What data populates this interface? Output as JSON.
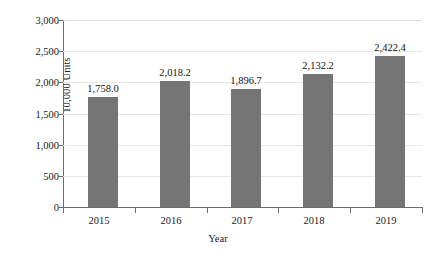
{
  "chart_data": {
    "type": "bar",
    "title": "",
    "xlabel": "Year",
    "ylabel": "10,000 Units",
    "categories": [
      "2015",
      "2016",
      "2017",
      "2018",
      "2019"
    ],
    "values": [
      1758.0,
      2018.2,
      1896.7,
      2132.2,
      2422.4
    ],
    "value_labels": [
      "1,758.0",
      "2,018.2",
      "1,896.7",
      "2,132.2",
      "2,422.4"
    ],
    "ylim": [
      0,
      3000
    ],
    "ytick_values": [
      0,
      500,
      1000,
      1500,
      2000,
      2500,
      3000
    ],
    "ytick_labels": [
      "0",
      "500",
      "1,000",
      "1,500",
      "2,000",
      "2,500",
      "3,000"
    ],
    "grid": true,
    "grid_axis": "y",
    "legend": false,
    "legend_position": "none",
    "bar_color": "#757575",
    "gridline_color": "#e8e8e8",
    "axis_color": "#6d6d6d",
    "background_color": "#ffffff"
  }
}
